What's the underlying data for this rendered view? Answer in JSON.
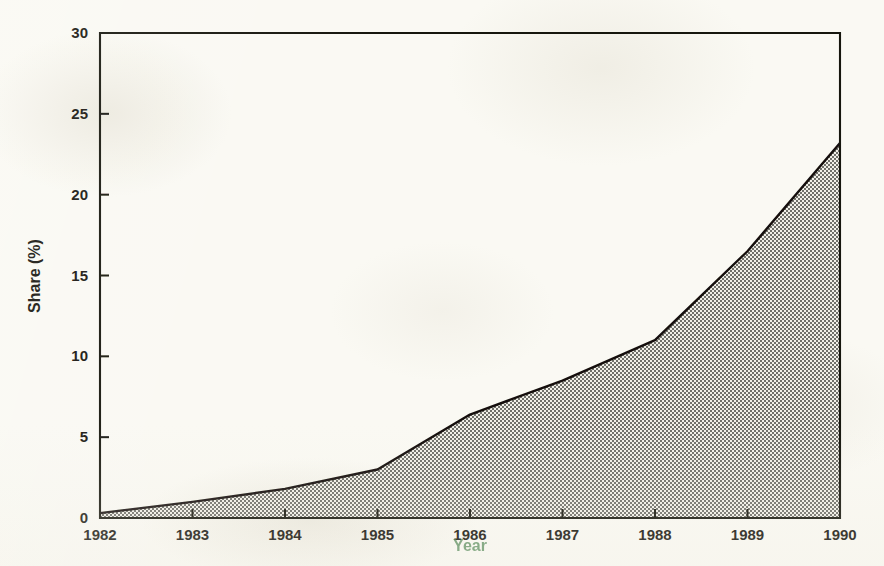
{
  "figure": {
    "background_color": "#faf9f3",
    "ink_color": "#141209",
    "fill_color": "#9a9a9a",
    "xlabel_color": "#3d7a43"
  },
  "chart_data": {
    "type": "area",
    "title": "",
    "xlabel": "Year",
    "ylabel": "Share (%)",
    "x": [
      1982,
      1983,
      1984,
      1985,
      1986,
      1987,
      1988,
      1989,
      1990
    ],
    "values": [
      0.3,
      1.0,
      1.8,
      3.0,
      6.4,
      8.5,
      11.0,
      16.5,
      23.2
    ],
    "xlim": [
      1982,
      1990
    ],
    "ylim": [
      0,
      30
    ],
    "xticks": [
      "1982",
      "1983",
      "1984",
      "1985",
      "1986",
      "1987",
      "1988",
      "1989",
      "1990"
    ],
    "yticks": [
      "0",
      "5",
      "10",
      "15",
      "20",
      "25",
      "30"
    ],
    "ytick_values": [
      0,
      5,
      10,
      15,
      20,
      25,
      30
    ],
    "grid": false,
    "legend": "none",
    "series_name": "Share",
    "fill_pattern": "halftone-dither-gray"
  }
}
